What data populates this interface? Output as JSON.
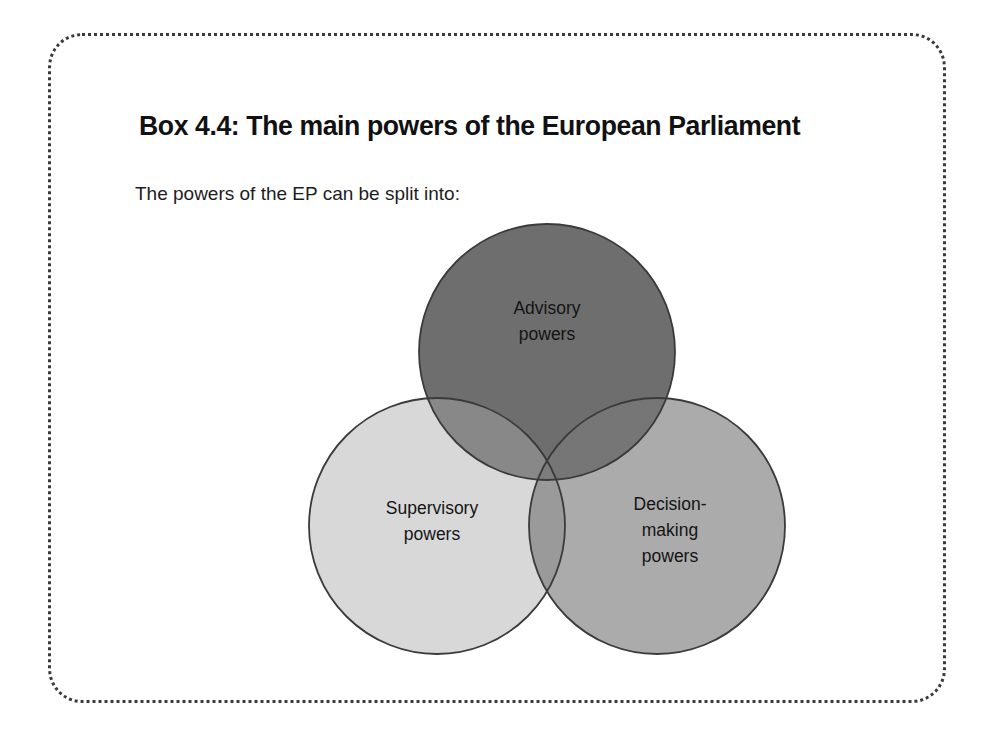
{
  "box": {
    "title": "Box 4.4: The main powers of the European Parliament",
    "intro": "The powers of the EP can be split into:",
    "border_style": "dotted",
    "border_color": "#3a3a3a",
    "background_color": "#ffffff"
  },
  "diagram": {
    "type": "venn",
    "set_count": 3,
    "circles": [
      {
        "id": "advisory",
        "label_lines": [
          "Advisory",
          "powers"
        ],
        "label_text": "Advisory powers",
        "fill_color": "#6e6e6e",
        "stroke_color": "#3b3b3b",
        "position": "top"
      },
      {
        "id": "supervisory",
        "label_lines": [
          "Supervisory",
          "powers"
        ],
        "label_text": "Supervisory powers",
        "fill_color": "#d8d8d8",
        "stroke_color": "#3b3b3b",
        "position": "bottom-left"
      },
      {
        "id": "decision-making",
        "label_lines": [
          "Decision-",
          "making",
          "powers"
        ],
        "label_text": "Decision-making powers",
        "fill_color": "#ababab",
        "stroke_color": "#3b3b3b",
        "position": "bottom-right"
      }
    ],
    "overlap_colors": {
      "advisory_supervisory": "#888888",
      "advisory_decision": "#767676",
      "supervisory_decision": "#9a9a9a",
      "all_three": "#7d7d7d"
    }
  }
}
